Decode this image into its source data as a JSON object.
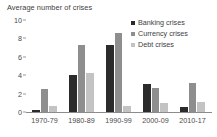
{
  "chart_data": {
    "type": "bar",
    "title": "Average number of crises",
    "xlabel": "",
    "ylabel": "",
    "ylim": [
      0,
      10
    ],
    "yticks": [
      0,
      2,
      4,
      6,
      8,
      10
    ],
    "grid": false,
    "legend_position": "top-right",
    "categories": [
      "1970-79",
      "1980-89",
      "1990-99",
      "2000-09",
      "2010-17"
    ],
    "series": [
      {
        "name": "Banking crises",
        "color": "#2b2b2b",
        "values": [
          0.2,
          4.0,
          7.3,
          3.0,
          0.5
        ]
      },
      {
        "name": "Currency crises",
        "color": "#8e8e8e",
        "values": [
          2.5,
          7.3,
          8.6,
          2.6,
          3.1
        ]
      },
      {
        "name": "Debt crises",
        "color": "#c3c3c3",
        "values": [
          0.7,
          4.2,
          0.7,
          1.0,
          1.1
        ]
      }
    ]
  }
}
